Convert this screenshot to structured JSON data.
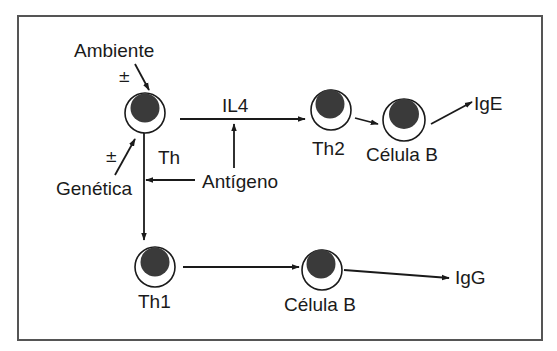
{
  "diagram": {
    "labels": {
      "ambiente": "Ambiente",
      "genetica": "Genética",
      "pm_ambiente": "±",
      "pm_genetica": "±",
      "th": "Th",
      "il4": "IL4",
      "antigeno": "Antígeno",
      "th2": "Th2",
      "celula_b_top": "Célula B",
      "ige": "IgE",
      "th1": "Th1",
      "celula_b_bottom": "Célula B",
      "igg": "IgG"
    },
    "colors": {
      "line": "#1a1a1a",
      "nucleus": "#3a3a3a",
      "frame": "#555555"
    },
    "nodes": [
      {
        "id": "th",
        "label": "Th"
      },
      {
        "id": "th2",
        "label": "Th2"
      },
      {
        "id": "celula_b_top",
        "label": "Célula B"
      },
      {
        "id": "th1",
        "label": "Th1"
      },
      {
        "id": "celula_b_bottom",
        "label": "Célula B"
      }
    ],
    "edges": [
      {
        "from": "Ambiente",
        "to": "Th",
        "sign": "±"
      },
      {
        "from": "Genética",
        "to": "Th",
        "sign": "±"
      },
      {
        "from": "Th",
        "to": "Th2",
        "label": "IL4"
      },
      {
        "from": "Antígeno",
        "to": "IL4 pathway"
      },
      {
        "from": "Antígeno",
        "to": "Th→Th1 pathway"
      },
      {
        "from": "Th2",
        "to": "Célula B"
      },
      {
        "from": "Célula B",
        "to": "IgE"
      },
      {
        "from": "Th",
        "to": "Th1"
      },
      {
        "from": "Th1",
        "to": "Célula B"
      },
      {
        "from": "Célula B",
        "to": "IgG"
      }
    ]
  }
}
